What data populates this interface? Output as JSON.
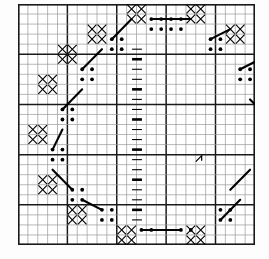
{
  "document": {
    "title": "Needlework Chart",
    "kind": "cross-stitch-pattern-grid",
    "description": "Octagonal wreath border pattern on a square counted-thread grid with a vertical backstitch column at the centre"
  },
  "colors": {
    "background": "#ffffff",
    "page": "#fdfdfd",
    "grid_line": "#9a9a9a",
    "grid_line_heavy": "#1a1a1a",
    "border": "#1a1a1a",
    "symbol": "#000000",
    "stitch_line": "#000000"
  },
  "grid": {
    "columns": 24,
    "rows": 24,
    "cell_size": 9.875,
    "heavy_every": 5,
    "outer_border": true,
    "grid_visible": true,
    "origin_x": 18,
    "origin_y": 4,
    "width": 237,
    "height": 241
  },
  "legend": {
    "cross_symbol": "X",
    "dot_symbol": "•",
    "dash_symbol": "—",
    "cross_label": "cross stitch",
    "dot_label": "french knot",
    "dash_label": "backstitch"
  },
  "chart_data": {
    "type": "grid-pattern",
    "cross_cells": [
      [
        11,
        0
      ],
      [
        12,
        0
      ],
      [
        17,
        0
      ],
      [
        18,
        0
      ],
      [
        11,
        1
      ],
      [
        12,
        1
      ],
      [
        17,
        1
      ],
      [
        18,
        1
      ],
      [
        7,
        2
      ],
      [
        8,
        2
      ],
      [
        21,
        2
      ],
      [
        22,
        2
      ],
      [
        7,
        3
      ],
      [
        8,
        3
      ],
      [
        21,
        3
      ],
      [
        22,
        3
      ],
      [
        4,
        4
      ],
      [
        5,
        4
      ],
      [
        24,
        4
      ],
      [
        25,
        4
      ],
      [
        4,
        5
      ],
      [
        5,
        5
      ],
      [
        2,
        7
      ],
      [
        3,
        7
      ],
      [
        2,
        8
      ],
      [
        3,
        8
      ],
      [
        1,
        12
      ],
      [
        2,
        12
      ],
      [
        1,
        13
      ],
      [
        2,
        13
      ],
      [
        2,
        17
      ],
      [
        3,
        17
      ],
      [
        2,
        18
      ],
      [
        3,
        18
      ],
      [
        5,
        20
      ],
      [
        6,
        20
      ],
      [
        5,
        21
      ],
      [
        6,
        21
      ],
      [
        10,
        22
      ],
      [
        11,
        22
      ],
      [
        17,
        22
      ],
      [
        18,
        22
      ],
      [
        10,
        23
      ],
      [
        11,
        23
      ],
      [
        17,
        23
      ],
      [
        18,
        23
      ]
    ],
    "dot_cells": [
      [
        13,
        1
      ],
      [
        14,
        1
      ],
      [
        15,
        1
      ],
      [
        16,
        1
      ],
      [
        13,
        2
      ],
      [
        14,
        2
      ],
      [
        15,
        2
      ],
      [
        16,
        2
      ],
      [
        9,
        3
      ],
      [
        10,
        3
      ],
      [
        19,
        3
      ],
      [
        20,
        3
      ],
      [
        9,
        4
      ],
      [
        10,
        4
      ],
      [
        19,
        4
      ],
      [
        20,
        4
      ],
      [
        6,
        6
      ],
      [
        7,
        6
      ],
      [
        22,
        6
      ],
      [
        23,
        6
      ],
      [
        6,
        7
      ],
      [
        7,
        7
      ],
      [
        22,
        7
      ],
      [
        23,
        7
      ],
      [
        4,
        10
      ],
      [
        5,
        10
      ],
      [
        24,
        10
      ],
      [
        25,
        10
      ],
      [
        4,
        11
      ],
      [
        5,
        11
      ],
      [
        3,
        14
      ],
      [
        4,
        14
      ],
      [
        3,
        15
      ],
      [
        4,
        15
      ],
      [
        5,
        18
      ],
      [
        6,
        18
      ],
      [
        5,
        19
      ],
      [
        6,
        19
      ],
      [
        8,
        20
      ],
      [
        9,
        20
      ],
      [
        20,
        20
      ],
      [
        21,
        20
      ],
      [
        8,
        21
      ],
      [
        9,
        21
      ],
      [
        20,
        21
      ],
      [
        21,
        21
      ],
      [
        12,
        22
      ],
      [
        13,
        22
      ],
      [
        16,
        22
      ],
      [
        17,
        22
      ]
    ],
    "backstitch_column": {
      "column": 12,
      "row_start": 4,
      "row_end": 21,
      "dash_count": 18
    },
    "connector_segments": [
      {
        "from": [
          13,
          1
        ],
        "to": [
          17,
          1
        ]
      },
      {
        "from": [
          9,
          3
        ],
        "to": [
          11,
          1
        ]
      },
      {
        "from": [
          19,
          3
        ],
        "to": [
          21,
          2
        ]
      },
      {
        "from": [
          6,
          6
        ],
        "to": [
          8,
          4
        ]
      },
      {
        "from": [
          22,
          6
        ],
        "to": [
          24,
          5
        ]
      },
      {
        "from": [
          4,
          10
        ],
        "to": [
          6,
          8
        ]
      },
      {
        "from": [
          23,
          9
        ],
        "to": [
          25,
          11
        ]
      },
      {
        "from": [
          3,
          14
        ],
        "to": [
          4,
          12
        ]
      },
      {
        "from": [
          24,
          14
        ],
        "to": [
          25,
          15
        ]
      },
      {
        "from": [
          5,
          18
        ],
        "to": [
          3,
          16
        ]
      },
      {
        "from": [
          21,
          18
        ],
        "to": [
          23,
          16
        ]
      },
      {
        "from": [
          8,
          20
        ],
        "to": [
          6,
          19
        ]
      },
      {
        "from": [
          20,
          21
        ],
        "to": [
          22,
          19
        ]
      },
      {
        "from": [
          12,
          22
        ],
        "to": [
          16,
          22
        ]
      }
    ],
    "marker_annotation": {
      "column": 18,
      "row": 15,
      "symbol": "arrow-tick"
    }
  }
}
